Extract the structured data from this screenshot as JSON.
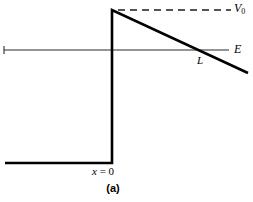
{
  "figure": {
    "caption": "(a)",
    "background_color": "#ffffff",
    "stroke_color": "#000000",
    "labels": {
      "barrier_height": "V",
      "barrier_height_subscript": "0",
      "energy_level": "E",
      "turning_point": "L",
      "origin_variable": "x",
      "origin_equals": "=",
      "origin_value": "0"
    }
  },
  "chart_data": {
    "type": "line",
    "title": "(a)",
    "xlabel": "",
    "ylabel": "",
    "grid": false,
    "legend": null,
    "xlim": [
      0,
      253
    ],
    "ylim": [
      202,
      0
    ],
    "series": [
      {
        "name": "potential-step-left",
        "style": "solid-thick",
        "points": [
          [
            5,
            163
          ],
          [
            112,
            163
          ]
        ]
      },
      {
        "name": "potential-step-vertical",
        "style": "solid-thick",
        "points": [
          [
            112,
            163
          ],
          [
            112,
            10
          ]
        ]
      },
      {
        "name": "potential-slope",
        "style": "solid-thick",
        "points": [
          [
            112,
            10
          ],
          [
            248,
            73
          ]
        ]
      },
      {
        "name": "barrier-height-dashed",
        "style": "dashed",
        "points": [
          [
            118,
            10
          ],
          [
            231,
            10
          ]
        ]
      },
      {
        "name": "energy-level-line",
        "style": "solid-thin",
        "points": [
          [
            4,
            50
          ],
          [
            229,
            50
          ]
        ]
      },
      {
        "name": "energy-level-left-tick",
        "style": "solid-thin",
        "points": [
          [
            4,
            46
          ],
          [
            4,
            54
          ]
        ]
      }
    ],
    "annotations": [
      {
        "text": "V0",
        "x": 236,
        "y": 9,
        "name": "barrier-height-label"
      },
      {
        "text": "E",
        "x": 236,
        "y": 50,
        "name": "energy-level-label"
      },
      {
        "text": "L",
        "x": 201,
        "y": 61,
        "name": "turning-point-label"
      },
      {
        "text": "x = 0",
        "x": 110,
        "y": 172,
        "name": "origin-label"
      },
      {
        "text": "(a)",
        "x": 113,
        "y": 190,
        "name": "figure-caption"
      }
    ],
    "intersection_point": {
      "name": "L",
      "x": 203,
      "y": 50
    }
  }
}
